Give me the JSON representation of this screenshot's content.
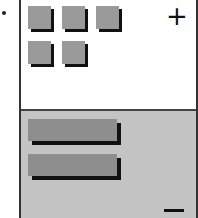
{
  "diagram": {
    "top_panel": {
      "items": 5,
      "shape": "square",
      "fill": "#9a9a9a",
      "background": "#ffffff"
    },
    "bottom_panel": {
      "items": 2,
      "shape": "bar",
      "fill": "#8e8e8e",
      "background": "#c4c4c4"
    },
    "plus_label": "+",
    "minus_label": ""
  }
}
